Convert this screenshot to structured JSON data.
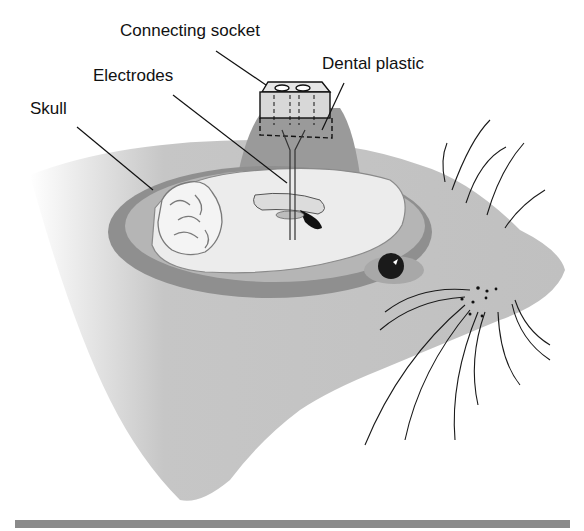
{
  "figure": {
    "labels": {
      "connecting_socket": "Connecting socket",
      "electrodes": "Electrodes",
      "dental_plastic": "Dental plastic",
      "skull": "Skull"
    },
    "colors": {
      "head_fill": "#c4c4c4",
      "skull_dark": "#8f8f8f",
      "dental_plastic": "#9a9a9a",
      "brain_fill": "#ececec",
      "outline": "#111111",
      "bottom_bar": "#8a8a8a"
    }
  }
}
